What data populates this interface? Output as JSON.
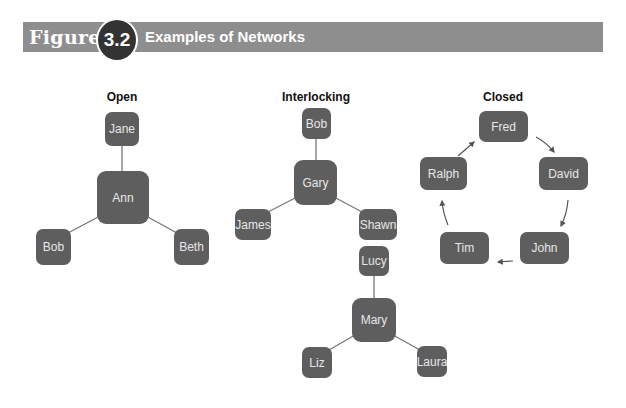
{
  "header": {
    "figure_label": "Figure",
    "figure_number": "3.2",
    "title": "Examples of Networks",
    "bar_color": "#8e8e8e",
    "badge_color": "#333333"
  },
  "node_color": "#5e5e5e",
  "sections": {
    "open": {
      "title": "Open",
      "nodes": {
        "center": "Ann",
        "top": "Jane",
        "left": "Bob",
        "right": "Beth"
      }
    },
    "interlocking": {
      "title": "Interlocking",
      "group1": {
        "center": "Gary",
        "top": "Bob",
        "left": "James",
        "right": "Shawn"
      },
      "group2": {
        "center": "Mary",
        "top": "Lucy",
        "left": "Liz",
        "right": "Laura"
      }
    },
    "closed": {
      "title": "Closed",
      "cycle": [
        "Fred",
        "David",
        "John",
        "Tim",
        "Ralph"
      ]
    }
  }
}
